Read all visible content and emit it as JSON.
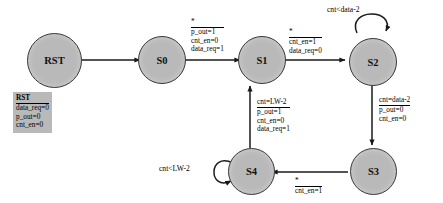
{
  "diagram": {
    "type": "finite-state-machine",
    "states": [
      {
        "id": "RST",
        "label": "RST"
      },
      {
        "id": "S0",
        "label": "S0"
      },
      {
        "id": "S1",
        "label": "S1"
      },
      {
        "id": "S2",
        "label": "S2"
      },
      {
        "id": "S3",
        "label": "S3"
      },
      {
        "id": "S4",
        "label": "S4"
      }
    ],
    "transitions": [
      {
        "from": "RST",
        "to": "S0",
        "condition": "",
        "outputs": []
      },
      {
        "from": "S0",
        "to": "S1",
        "condition": "*",
        "outputs": [
          "p_out=1",
          "cnt_en=0",
          "data_req=1"
        ]
      },
      {
        "from": "S1",
        "to": "S2",
        "condition": "*",
        "outputs": [
          "cnt_en=1",
          "data_req=0"
        ]
      },
      {
        "from": "S2",
        "to": "S2",
        "condition": "cnt<data-2",
        "outputs": [],
        "self": true
      },
      {
        "from": "S2",
        "to": "S3",
        "condition": "cnt=data-2",
        "outputs": [
          "p_out=0",
          "cnt_en=0"
        ]
      },
      {
        "from": "S3",
        "to": "S4",
        "condition": "*",
        "outputs": [
          "cnt_en=1"
        ]
      },
      {
        "from": "S4",
        "to": "S4",
        "condition": "cnt<LW-2",
        "outputs": [],
        "self": true
      },
      {
        "from": "S4",
        "to": "S1",
        "condition": "cnt=LW-2",
        "outputs": [
          "p_out=1",
          "cnt_en=0",
          "data_req=1"
        ]
      }
    ],
    "reset_note": {
      "header": "RST",
      "lines": [
        "data_req=0",
        "p_out=0",
        "cnt_en=0"
      ]
    },
    "colors": {
      "state_fill": "#b9b9b9",
      "state_stroke": "#3a3a3a",
      "note_fill": "#b9b9b9",
      "edge": "#1a1a1a",
      "text": "#000000",
      "background": "#ffffff"
    }
  }
}
